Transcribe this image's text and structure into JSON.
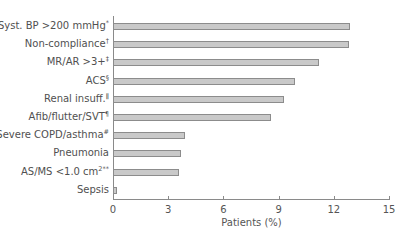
{
  "chart_data": {
    "type": "bar",
    "orientation": "horizontal",
    "title": "",
    "xlabel": "Patients (%)",
    "ylabel": "",
    "xlim": [
      0,
      15
    ],
    "xticks": [
      0,
      3,
      6,
      9,
      12,
      15
    ],
    "grid": false,
    "legend": null,
    "categories": [
      {
        "text": "Syst. BP >200 mmHg",
        "sup": "*"
      },
      {
        "text": "Non-compliance",
        "sup": "†"
      },
      {
        "text": "MR/AR >3+",
        "sup": "‡"
      },
      {
        "text": "ACS",
        "sup": "§"
      },
      {
        "text": "Renal insuff.",
        "sup": "ǁ"
      },
      {
        "text": "Afib/flutter/SVT",
        "sup": "¶"
      },
      {
        "text": "Severe COPD/asthma",
        "sup": "#"
      },
      {
        "text": "Pneumonia",
        "sup": ""
      },
      {
        "text": "AS/MS <1.0 cm",
        "sup": "2**"
      },
      {
        "text": "Sepsis",
        "sup": ""
      }
    ],
    "values": [
      12.9,
      12.8,
      11.2,
      9.9,
      9.3,
      8.6,
      3.9,
      3.7,
      3.6,
      0.2
    ],
    "colors": {
      "bar_fill": "#c9c9c9",
      "bar_border": "#8c8c8c",
      "axis": "#8a8a8a"
    }
  }
}
